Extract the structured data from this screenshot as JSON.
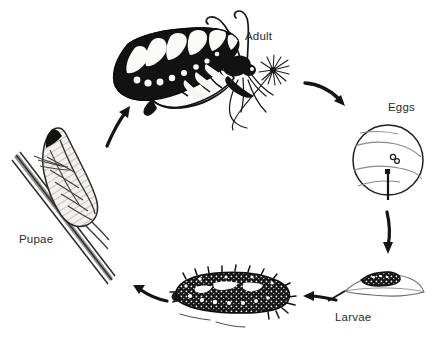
{
  "diagram": {
    "type": "cycle-diagram",
    "style": "black-and-white pen-and-ink scientific illustration",
    "background_color": "#ffffff",
    "ink_color": "#111111",
    "label_color": "#2b2b2b",
    "stages": [
      {
        "id": "adult",
        "label": "Adult",
        "description": "Side view of an adult swallowtail butterfly with folded wings bearing black and white banded markings, two curved antennae, thin legs, feeding on a flower head"
      },
      {
        "id": "eggs",
        "label": "Eggs",
        "description": "Circular magnified inset of a leaf surface showing two small round eggs and a leaf vein with a stem",
        "egg_count": 2
      },
      {
        "id": "larvae",
        "label": "Larvae",
        "description": "Two larval stages: a small dark early instar caterpillar resting on a leaf, and a large late instar caterpillar covered in spiny tubercles"
      },
      {
        "id": "pupae",
        "label": "Pupae",
        "description": "Chrysalis attached upright to a diagonal plant stem by a silk girdle"
      }
    ],
    "arrows": [
      {
        "id": "arrow-adult-to-eggs",
        "from": "adult",
        "to": "eggs",
        "direction": "down-right"
      },
      {
        "id": "arrow-eggs-to-larvae",
        "from": "eggs",
        "to": "larvae",
        "direction": "down"
      },
      {
        "id": "arrow-larvae-to-larvae",
        "from": "larvae",
        "to": "larvae",
        "direction": "left"
      },
      {
        "id": "arrow-larvae-to-pupae",
        "from": "larvae",
        "to": "pupae",
        "direction": "left"
      },
      {
        "id": "arrow-pupae-to-adult",
        "from": "pupae",
        "to": "adult",
        "direction": "up-right"
      }
    ]
  }
}
